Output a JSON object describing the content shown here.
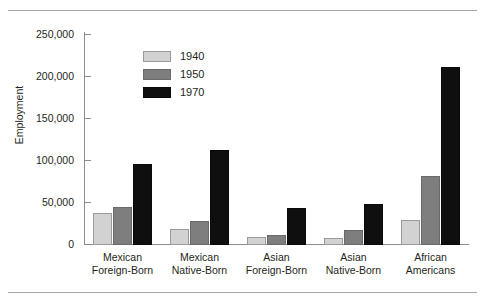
{
  "chart_data": {
    "type": "bar",
    "title": "",
    "xlabel": "",
    "ylabel": "Employment",
    "ylim": [
      0,
      260000
    ],
    "grid": false,
    "legend_position": "upper-left-inside",
    "y_ticks": [
      0,
      50000,
      100000,
      150000,
      200000,
      250000
    ],
    "y_tick_labels": [
      "0",
      "50,000",
      "100,000",
      "150,000",
      "200,000",
      "250,000"
    ],
    "categories": [
      "Mexican Foreign-Born",
      "Mexican Native-Born",
      "Asian Foreign-Born",
      "Asian Native-Born",
      "African Americans"
    ],
    "category_lines": [
      [
        "Mexican",
        "Foreign-Born"
      ],
      [
        "Mexican",
        "Native-Born"
      ],
      [
        "Asian",
        "Foreign-Born"
      ],
      [
        "Asian",
        "Native-Born"
      ],
      [
        "African",
        "Americans"
      ]
    ],
    "series": [
      {
        "name": "1940",
        "color": "#d2d2d2",
        "values": [
          38000,
          19000,
          10000,
          8000,
          30000
        ]
      },
      {
        "name": "1950",
        "color": "#7e7e7e",
        "values": [
          45000,
          29000,
          12000,
          18000,
          82000
        ]
      },
      {
        "name": "1970",
        "color": "#100f0f",
        "values": [
          96500,
          113000,
          44000,
          49000,
          212000
        ]
      }
    ]
  },
  "axis": {
    "y_title": "Employment",
    "ticks": [
      {
        "label": "250,000",
        "value": 250000
      },
      {
        "label": "200,000",
        "value": 200000
      },
      {
        "label": "150,000",
        "value": 150000
      },
      {
        "label": "100,000",
        "value": 100000
      },
      {
        "label": "50,000",
        "value": 50000
      },
      {
        "label": "0",
        "value": 0
      }
    ]
  },
  "legend": {
    "entries": [
      {
        "label": "1940",
        "swatch": "legend-swatch-1940"
      },
      {
        "label": "1950",
        "swatch": "legend-swatch-1950"
      },
      {
        "label": "1970",
        "swatch": "legend-swatch-1970"
      }
    ]
  },
  "colors": {
    "series_1940": "#d2d2d2",
    "series_1950": "#7e7e7e",
    "series_1970": "#100f0f",
    "axis": "#8c8c8c",
    "rule": "#a7a7a7",
    "text": "#231f20",
    "background": "#ffffff"
  }
}
